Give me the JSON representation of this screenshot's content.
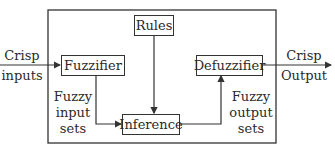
{
  "diagram": {
    "blocks": {
      "fuzzifier": "Fuzzifier",
      "rules": "Rules",
      "inference": "Inference",
      "defuzzifier": "Defuzzifier"
    },
    "labels": {
      "input_line1": "Crisp",
      "input_line2": "inputs",
      "output_line1": "Crisp",
      "output_line2": "Output",
      "fuzzy_input_line1": "Fuzzy",
      "fuzzy_input_line2": "input",
      "fuzzy_input_line3": "sets",
      "fuzzy_output_line1": "Fuzzy",
      "fuzzy_output_line2": "output",
      "fuzzy_output_line3": "sets"
    },
    "colors": {
      "line": "#333333",
      "background": "#ffffff"
    }
  }
}
